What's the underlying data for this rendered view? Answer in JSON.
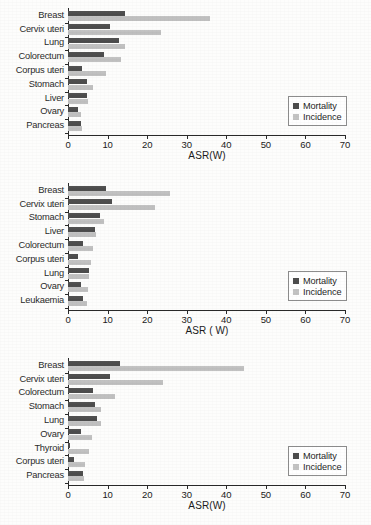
{
  "figure": {
    "width": 371,
    "height": 525,
    "colors": {
      "mortality": "#4d4d4d",
      "incidence": "#c3c3c3",
      "axis": "#2a2a2a",
      "background": "#fdfdfc"
    }
  },
  "legend": {
    "mortality_label": "Mortality",
    "incidence_label": "Incidence",
    "mortality_swatch": "mortality-swatch",
    "incidence_swatch": "incidence-swatch"
  },
  "axis": {
    "ticks": [
      "0",
      "10",
      "20",
      "30",
      "40",
      "50",
      "60",
      "70"
    ],
    "tick_values": [
      0,
      10,
      20,
      30,
      40,
      50,
      60,
      70
    ],
    "xmin": 0,
    "xmax": 70
  },
  "chart_data": [
    {
      "id": "chart-1",
      "type": "bar",
      "orientation": "horizontal",
      "title": "",
      "xlabel": "ASR(W)",
      "ylabel": "",
      "xlim": [
        0,
        70
      ],
      "grid": false,
      "legend_position": "right",
      "categories": [
        "Breast",
        "Cervix uteri",
        "Lung",
        "Colorectum",
        "Corpus uteri",
        "Stomach",
        "Liver",
        "Ovary",
        "Pancreas"
      ],
      "series": [
        {
          "name": "Mortality",
          "values": [
            14.4,
            10.7,
            13.0,
            9.0,
            3.6,
            4.8,
            4.9,
            2.5,
            3.4
          ]
        },
        {
          "name": "Incidence",
          "values": [
            35.9,
            23.5,
            14.3,
            13.5,
            9.6,
            6.2,
            5.1,
            3.4,
            3.5
          ]
        }
      ]
    },
    {
      "id": "chart-2",
      "type": "bar",
      "orientation": "horizontal",
      "title": "",
      "xlabel": "ASR ( W)",
      "ylabel": "",
      "xlim": [
        0,
        70
      ],
      "grid": false,
      "legend_position": "right",
      "categories": [
        "Breast",
        "Cervix uteri",
        "Stomach",
        "Liver",
        "Colorectum",
        "Corpus uteri",
        "Lung",
        "Ovary",
        "Leukaemia"
      ],
      "series": [
        {
          "name": "Mortality",
          "values": [
            9.6,
            11.1,
            8.0,
            6.9,
            3.9,
            2.5,
            5.2,
            3.2,
            3.7
          ]
        },
        {
          "name": "Incidence",
          "values": [
            25.9,
            22.1,
            9.2,
            7.0,
            6.3,
            5.8,
            5.4,
            5.0,
            4.8
          ]
        }
      ]
    },
    {
      "id": "chart-3",
      "type": "bar",
      "orientation": "horizontal",
      "title": "",
      "xlabel": "ASR(W)",
      "ylabel": "",
      "xlim": [
        0,
        70
      ],
      "grid": false,
      "legend_position": "right",
      "categories": [
        "Breast",
        "Cervix uteri",
        "Colorectum",
        "Stomach",
        "Lung",
        "Ovary",
        "Thyroid",
        "Corpus uteri",
        "Pancreas"
      ],
      "series": [
        {
          "name": "Mortality",
          "values": [
            13.2,
            10.6,
            6.4,
            6.9,
            7.4,
            3.2,
            0.5,
            1.5,
            3.8
          ]
        },
        {
          "name": "Incidence",
          "values": [
            44.5,
            24.0,
            11.9,
            8.3,
            8.3,
            6.1,
            5.3,
            4.2,
            4.0
          ]
        }
      ]
    }
  ]
}
